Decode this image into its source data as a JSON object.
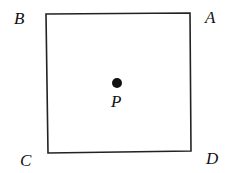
{
  "diagram": {
    "type": "square-with-center-point",
    "stroke_color": "#222222",
    "background": "#ffffff",
    "vertices": [
      {
        "label": "A",
        "position": "top-right"
      },
      {
        "label": "B",
        "position": "top-left"
      },
      {
        "label": "C",
        "position": "bottom-left"
      },
      {
        "label": "D",
        "position": "bottom-right"
      }
    ],
    "center_point": {
      "label": "P"
    }
  }
}
